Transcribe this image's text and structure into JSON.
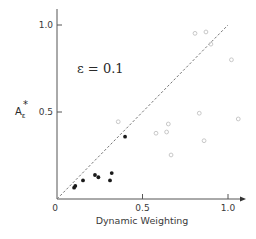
{
  "chart_data": {
    "type": "scatter",
    "title": "",
    "xlabel": "Dynamic Weighting",
    "ylabel": "A*ε",
    "ylabel_main": "A",
    "ylabel_sup": "*",
    "ylabel_sub": "ε",
    "xlim": [
      0,
      1.05
    ],
    "ylim": [
      0,
      1.05
    ],
    "x_ticks": [
      0,
      0.5,
      1.0
    ],
    "x_tick_labels": [
      "0",
      "0.5",
      "1.0"
    ],
    "y_ticks": [
      0.5,
      1.0
    ],
    "y_tick_labels": [
      "0.5",
      "1.0"
    ],
    "grid": false,
    "annotations": [
      {
        "text": "ε = 0.1",
        "x": 0.12,
        "y": 0.75
      }
    ],
    "reference_line": {
      "style": "dashed",
      "from": [
        0,
        0
      ],
      "to": [
        1.0,
        1.0
      ],
      "label": "y = x"
    },
    "series": [
      {
        "name": "filled",
        "marker": "filled-circle",
        "color": "#1a1a1a",
        "points": [
          {
            "x": 0.1,
            "y": 0.065
          },
          {
            "x": 0.107,
            "y": 0.075
          },
          {
            "x": 0.152,
            "y": 0.107
          },
          {
            "x": 0.222,
            "y": 0.138
          },
          {
            "x": 0.242,
            "y": 0.125
          },
          {
            "x": 0.31,
            "y": 0.107
          },
          {
            "x": 0.32,
            "y": 0.149
          },
          {
            "x": 0.398,
            "y": 0.358
          }
        ]
      },
      {
        "name": "open",
        "marker": "open-circle",
        "color": "#c8c8c8",
        "points": [
          {
            "x": 0.807,
            "y": 0.952
          },
          {
            "x": 0.871,
            "y": 0.96
          },
          {
            "x": 0.9,
            "y": 0.89
          },
          {
            "x": 1.02,
            "y": 0.8
          },
          {
            "x": 0.358,
            "y": 0.444
          },
          {
            "x": 0.579,
            "y": 0.378
          },
          {
            "x": 0.641,
            "y": 0.385
          },
          {
            "x": 0.651,
            "y": 0.431
          },
          {
            "x": 0.832,
            "y": 0.493
          },
          {
            "x": 1.06,
            "y": 0.46
          },
          {
            "x": 0.86,
            "y": 0.335
          },
          {
            "x": 0.667,
            "y": 0.253
          }
        ]
      }
    ]
  },
  "layout": {
    "origin_px": [
      57,
      199
    ],
    "x_px_per_unit": 171,
    "y_px_per_unit": 174,
    "x_axis_end_px": 246,
    "y_axis_top_px": 9,
    "axis_color": "#555555",
    "dash_color": "#777777"
  }
}
